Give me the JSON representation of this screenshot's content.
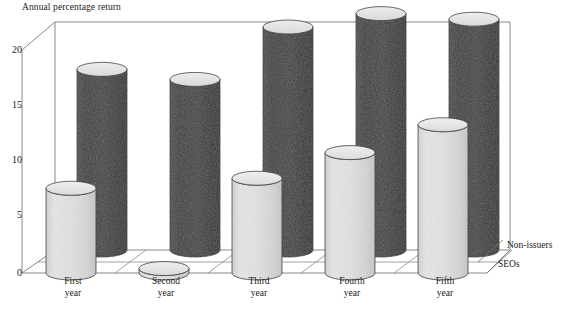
{
  "chart_data": {
    "type": "bar",
    "title": "",
    "ylabel": "Annual percentage return",
    "xlabel": "",
    "ylim": [
      0,
      20
    ],
    "yticks": [
      0,
      5,
      10,
      15,
      20
    ],
    "grid": false,
    "legend_position": "right-bottom",
    "three_d": true,
    "categories": [
      "First year",
      "Second year",
      "Third year",
      "Fourth year",
      "Fifth year"
    ],
    "series": [
      {
        "name": "Non-issuers",
        "values": [
          16.2,
          15.3,
          20.0,
          21.2,
          20.7
        ],
        "color": "#3f3f3f"
      },
      {
        "name": "SEOs",
        "values": [
          7.6,
          0.4,
          8.5,
          10.8,
          13.3
        ],
        "color": "#e2e2e2"
      }
    ]
  },
  "axis": {
    "title": "Annual percentage return",
    "tick_labels": [
      "20",
      "15",
      "10",
      "5",
      "0"
    ]
  },
  "categories": [
    {
      "line1": "First",
      "line2": "year"
    },
    {
      "line1": "Second",
      "line2": "year"
    },
    {
      "line1": "Third",
      "line2": "year"
    },
    {
      "line1": "Fourth",
      "line2": "year"
    },
    {
      "line1": "Fifth",
      "line2": "year"
    }
  ],
  "legend": {
    "back_label": "Non-issuers",
    "front_label": "SEOs"
  },
  "caption": {
    "text": ""
  }
}
